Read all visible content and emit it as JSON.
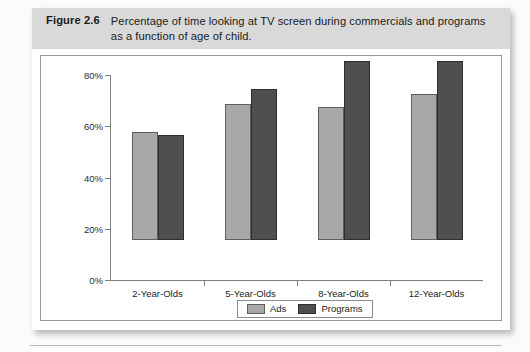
{
  "figure": {
    "label": "Figure 2.6",
    "caption": "Percentage of time looking at TV screen during commercials and programs as a function of age of child."
  },
  "chart_data": {
    "type": "bar",
    "title": "Percentage of time looking at TV screen during commercials and programs as a function of age of child.",
    "categories": [
      "2-Year-Olds",
      "5-Year-Olds",
      "8-Year-Olds",
      "12-Year-Olds"
    ],
    "series": [
      {
        "name": "Ads",
        "color": "#a8a8a8",
        "values": [
          42,
          53,
          52,
          57
        ]
      },
      {
        "name": "Programs",
        "color": "#4f4f4f",
        "values": [
          41,
          59,
          70,
          70
        ]
      }
    ],
    "xlabel": "",
    "ylabel": "",
    "ylim": [
      0,
      80
    ],
    "ytick_values": [
      0,
      20,
      40,
      60,
      80
    ],
    "ytick_labels": [
      "0%",
      "20%",
      "40%",
      "60%",
      "80%"
    ],
    "grid": false,
    "legend_position": "bottom-center",
    "legend_entries": [
      "Ads",
      "Programs"
    ]
  }
}
